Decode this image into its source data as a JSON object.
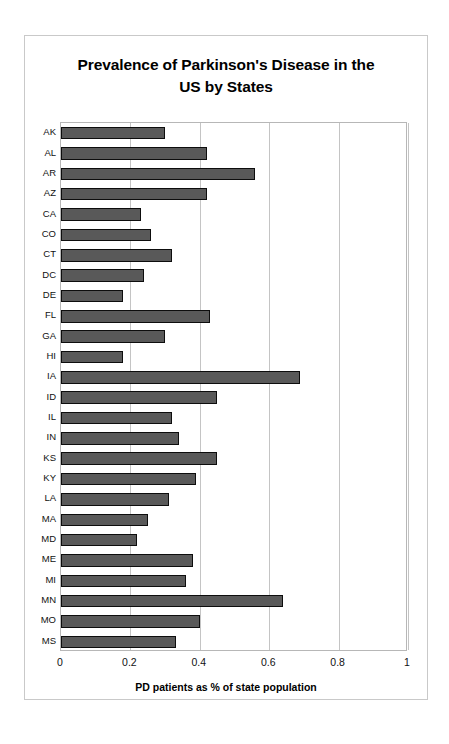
{
  "chart_data": {
    "type": "bar",
    "orientation": "horizontal",
    "title": "Prevalence of Parkinson's Disease in the US by States",
    "title_line1": "Prevalence of Parkinson's Disease in the",
    "title_line2": "US by States",
    "xlabel": "PD patients as % of state population",
    "ylabel": "",
    "xlim": [
      0,
      1
    ],
    "xticks": [
      "0",
      "0.2",
      "0.4",
      "0.6",
      "0.8",
      "1"
    ],
    "xtick_values": [
      0,
      0.2,
      0.4,
      0.6,
      0.8,
      1
    ],
    "grid": "vertical",
    "legend": "none",
    "bar_color": "#595959",
    "bar_edge_color": "#0d0d0d",
    "categories": [
      "AK",
      "AL",
      "AR",
      "AZ",
      "CA",
      "CO",
      "CT",
      "DC",
      "DE",
      "FL",
      "GA",
      "HI",
      "IA",
      "ID",
      "IL",
      "IN",
      "KS",
      "KY",
      "LA",
      "MA",
      "MD",
      "ME",
      "MI",
      "MN",
      "MO",
      "MS"
    ],
    "values": [
      0.3,
      0.42,
      0.56,
      0.42,
      0.23,
      0.26,
      0.32,
      0.24,
      0.18,
      0.43,
      0.3,
      0.18,
      0.69,
      0.45,
      0.32,
      0.34,
      0.45,
      0.39,
      0.31,
      0.25,
      0.22,
      0.38,
      0.36,
      0.64,
      0.4,
      0.33
    ]
  }
}
